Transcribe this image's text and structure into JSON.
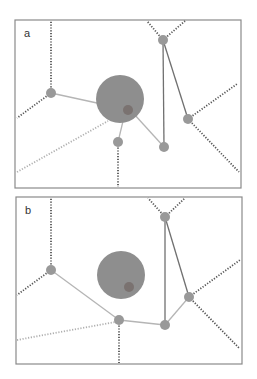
{
  "colors": {
    "frame": "#8a8a8a",
    "node": "#999999",
    "big_circle": "#8e8e8e",
    "small_circle": "#7a7270",
    "solid_light": "#b5b5b5",
    "solid_dark": "#707070",
    "dotted_dark": "#555555",
    "dotted_light": "#b0b0b0"
  },
  "panels": [
    {
      "label": "a",
      "frame": {
        "x": 15,
        "y": 20,
        "w": 226,
        "h": 168
      },
      "big_circle": {
        "cx": 120,
        "cy": 99,
        "r": 24
      },
      "small_circle": {
        "cx": 128,
        "cy": 110,
        "r": 5
      },
      "nodes": [
        {
          "id": "left",
          "cx": 51,
          "cy": 93
        },
        {
          "id": "lower-mid",
          "cx": 118,
          "cy": 142
        },
        {
          "id": "bottom-right",
          "cx": 164,
          "cy": 147
        },
        {
          "id": "top",
          "cx": 163,
          "cy": 40
        },
        {
          "id": "right",
          "cx": 188,
          "cy": 119
        }
      ],
      "solid_light_edges": [
        [
          51,
          93,
          97,
          103
        ],
        [
          124,
          117,
          118,
          142
        ],
        [
          134,
          114,
          164,
          147
        ]
      ],
      "solid_dark_edges": [
        [
          163,
          40,
          164,
          147
        ],
        [
          163,
          40,
          188,
          119
        ]
      ],
      "dotted_dark_edges": [
        [
          51,
          93,
          51,
          21
        ],
        [
          51,
          93,
          17,
          118
        ],
        [
          118,
          142,
          118,
          187
        ],
        [
          163,
          40,
          147,
          21
        ],
        [
          163,
          40,
          185,
          21
        ],
        [
          188,
          119,
          237,
          84
        ],
        [
          188,
          119,
          239,
          172
        ]
      ],
      "dotted_light_edges": [
        [
          17,
          172,
          108,
          121
        ]
      ]
    },
    {
      "label": "b",
      "frame": {
        "x": 16,
        "y": 197,
        "w": 226,
        "h": 167
      },
      "big_circle": {
        "cx": 121,
        "cy": 275,
        "r": 24
      },
      "small_circle": {
        "cx": 129,
        "cy": 287,
        "r": 5
      },
      "nodes": [
        {
          "id": "left",
          "cx": 51,
          "cy": 270
        },
        {
          "id": "lower-mid",
          "cx": 119,
          "cy": 320
        },
        {
          "id": "bottom-right",
          "cx": 165,
          "cy": 325
        },
        {
          "id": "top",
          "cx": 165,
          "cy": 217
        },
        {
          "id": "right",
          "cx": 189,
          "cy": 297
        }
      ],
      "solid_light_edges": [
        [
          51,
          270,
          119,
          320
        ],
        [
          119,
          320,
          165,
          325
        ],
        [
          165,
          325,
          189,
          297
        ]
      ],
      "solid_dark_edges": [
        [
          165,
          217,
          165,
          325
        ],
        [
          165,
          217,
          189,
          297
        ]
      ],
      "dotted_dark_edges": [
        [
          51,
          270,
          51,
          198
        ],
        [
          51,
          270,
          17,
          295
        ],
        [
          119,
          320,
          119,
          363
        ],
        [
          165,
          217,
          148,
          198
        ],
        [
          165,
          217,
          185,
          198
        ],
        [
          189,
          297,
          240,
          260
        ],
        [
          189,
          297,
          239,
          348
        ]
      ],
      "dotted_light_edges": [
        [
          17,
          340,
          115,
          322
        ]
      ]
    }
  ]
}
